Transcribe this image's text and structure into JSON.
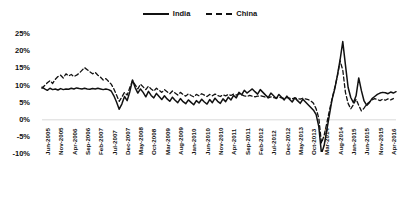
{
  "chart_data": {
    "type": "line",
    "title": "",
    "xlabel": "",
    "ylabel": "",
    "ylim": [
      -10,
      25
    ],
    "yticks": [
      "-10%",
      "-5%",
      "0%",
      "5%",
      "10%",
      "15%",
      "20%",
      "25%"
    ],
    "ytick_values": [
      -10,
      -5,
      0,
      5,
      10,
      15,
      20,
      25
    ],
    "grid": false,
    "legend_position": "top-center",
    "x_tick_labels": [
      "Jun-2005",
      "Nov-2005",
      "Apr-2006",
      "Sep-2006",
      "Feb-2007",
      "Jul-2007",
      "Dec-2007",
      "May-2008",
      "Oct-2008",
      "Mar-2009",
      "Aug-2009",
      "Jan-2010",
      "Jun-2010",
      "Nov-2010",
      "Apr-2011",
      "Sep-2011",
      "Feb-2012",
      "Jul-2012",
      "Dec-2012",
      "May-2013",
      "Oct-2013",
      "Mar-2014",
      "Aug-2014",
      "Jan-2015",
      "Jun-2015",
      "Nov-2015",
      "Apr-2016",
      "Sep-2016",
      "Feb-2017",
      "Jul-2017",
      "Dec-2017",
      "May-2018",
      "Oct-2018",
      "Mar-2019",
      "Aug-2019",
      "Jan-2020",
      "Jun-2020",
      "Nov-2020",
      "Apr-2021",
      "Sep-2021",
      "Feb-2022",
      "Jul-2022",
      "Dec-2022",
      "May-2023",
      "Oct-2023",
      "Mar-2024"
    ],
    "x_tick_interval_months": 5,
    "series": [
      {
        "name": "India",
        "style": "solid",
        "color": "#111111",
        "values": [
          9.5,
          9.0,
          8.6,
          9.2,
          8.8,
          9.0,
          8.7,
          9.1,
          8.8,
          9.0,
          8.9,
          9.2,
          9.0,
          9.3,
          9.1,
          9.0,
          9.2,
          9.0,
          8.9,
          9.1,
          9.0,
          9.2,
          9.0,
          8.8,
          9.0,
          8.8,
          8.4,
          7.0,
          5.2,
          3.1,
          4.6,
          6.8,
          5.6,
          8.2,
          11.6,
          9.4,
          7.8,
          9.0,
          8.0,
          6.7,
          8.3,
          7.1,
          6.4,
          7.7,
          6.8,
          5.9,
          7.0,
          6.1,
          5.4,
          6.6,
          5.7,
          5.0,
          6.2,
          5.3,
          4.7,
          5.8,
          5.1,
          4.4,
          5.6,
          4.9,
          6.0,
          5.2,
          4.6,
          5.9,
          5.0,
          6.3,
          5.4,
          4.8,
          6.1,
          5.3,
          6.6,
          5.8,
          7.1,
          6.4,
          8.0,
          7.3,
          8.6,
          7.8,
          8.4,
          9.0,
          8.2,
          7.5,
          8.8,
          8.0,
          7.2,
          6.5,
          7.8,
          7.0,
          6.2,
          7.4,
          6.6,
          5.8,
          6.9,
          6.0,
          5.2,
          6.4,
          5.6,
          4.8,
          6.0,
          5.2,
          4.4,
          3.6,
          2.8,
          1.5,
          -2.0,
          -9.8,
          -7.5,
          -3.0,
          1.5,
          6.0,
          9.0,
          13.0,
          17.5,
          22.8,
          16.0,
          9.5,
          6.5,
          5.0,
          7.0,
          12.2,
          8.5,
          5.5,
          4.2,
          5.0,
          6.2,
          6.8,
          7.4,
          7.8,
          8.0,
          7.9,
          7.6,
          8.1,
          7.8,
          8.2
        ]
      },
      {
        "name": "China",
        "style": "dashed",
        "color": "#111111",
        "values": [
          9.2,
          10.0,
          10.8,
          11.4,
          10.6,
          11.8,
          12.6,
          13.0,
          12.2,
          13.4,
          12.8,
          13.2,
          12.6,
          13.0,
          13.6,
          14.4,
          15.2,
          14.6,
          14.0,
          13.4,
          13.8,
          13.0,
          12.4,
          11.6,
          12.0,
          11.2,
          10.4,
          9.0,
          7.2,
          5.4,
          6.6,
          8.0,
          7.2,
          9.4,
          11.4,
          10.2,
          9.0,
          10.4,
          9.6,
          8.8,
          9.8,
          9.0,
          8.4,
          9.2,
          8.6,
          8.0,
          8.8,
          8.2,
          7.6,
          8.4,
          7.8,
          7.2,
          8.0,
          7.4,
          6.9,
          7.6,
          7.1,
          6.7,
          7.4,
          7.0,
          7.6,
          7.2,
          6.8,
          7.4,
          7.0,
          7.5,
          7.1,
          6.8,
          7.3,
          7.0,
          7.4,
          7.1,
          7.5,
          7.2,
          7.6,
          7.3,
          7.0,
          6.8,
          7.1,
          6.9,
          6.7,
          6.9,
          7.0,
          6.8,
          6.6,
          6.4,
          6.7,
          6.5,
          6.3,
          6.6,
          6.4,
          6.2,
          6.5,
          6.3,
          6.1,
          6.4,
          6.2,
          6.0,
          6.3,
          6.1,
          5.9,
          5.5,
          4.8,
          3.2,
          0.5,
          -6.8,
          -4.5,
          -1.0,
          2.8,
          6.2,
          9.4,
          12.8,
          17.2,
          14.5,
          8.0,
          4.8,
          3.2,
          4.4,
          6.0,
          4.2,
          2.6,
          3.4,
          4.6,
          5.2,
          5.8,
          6.2,
          5.9,
          5.6,
          6.0,
          5.7,
          6.1,
          5.8,
          6.2
        ]
      }
    ]
  },
  "legend": {
    "items": [
      {
        "label": "India",
        "style": "solid"
      },
      {
        "label": "China",
        "style": "dashed"
      }
    ]
  }
}
